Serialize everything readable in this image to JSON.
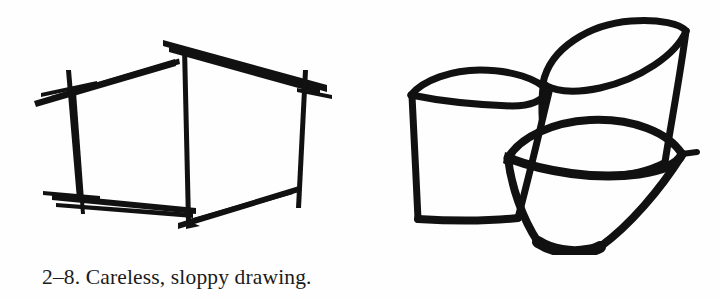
{
  "page": {
    "background_color": "#fefefe",
    "ink_color": "#111111",
    "width": 721,
    "height": 299
  },
  "caption": {
    "figure_number": "2–8.",
    "text": "2–8. Careless, sloppy drawing.",
    "description": "Careless, sloppy drawing."
  },
  "figure": {
    "title": "Careless, sloppy drawing",
    "style": "rough freehand pen-and-ink sketch, scanned from a printed book page",
    "drawings": [
      {
        "name": "sloppy-box-sketch",
        "subject": "rectangular box drawn in two-point perspective",
        "quality_notes": "lines overshoot at every corner, edges cross past each other, strokes waver and double back",
        "position": "left half of the figure"
      },
      {
        "name": "sloppy-cups-sketch",
        "subject": "three overlapping tapered cups / bowls",
        "quality_notes": "heavy blotted outlines, lumpy ellipses, pointed rims, uneven line weight",
        "position": "right half of the figure"
      }
    ]
  }
}
